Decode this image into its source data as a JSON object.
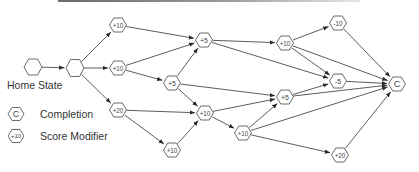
{
  "diagram": {
    "title_bar": "",
    "home_state_label": "Home State",
    "legend": {
      "items": [
        {
          "icon_text": "C",
          "label": "Completion"
        },
        {
          "icon_text": "+10",
          "label": "Score Modifier"
        }
      ]
    },
    "nodes": [
      {
        "id": "home",
        "label": "",
        "x": 33,
        "y": 67,
        "type": "start"
      },
      {
        "id": "hub",
        "label": "",
        "x": 75,
        "y": 68,
        "type": "hub"
      },
      {
        "id": "a1",
        "label": "+10",
        "x": 118,
        "y": 25,
        "type": "modifier"
      },
      {
        "id": "a2",
        "label": "+10",
        "x": 118,
        "y": 68,
        "type": "modifier"
      },
      {
        "id": "a3",
        "label": "+20",
        "x": 118,
        "y": 110,
        "type": "modifier"
      },
      {
        "id": "b1",
        "label": "+5",
        "x": 204,
        "y": 40,
        "type": "modifier"
      },
      {
        "id": "b2",
        "label": "+5",
        "x": 172,
        "y": 83,
        "type": "modifier"
      },
      {
        "id": "b3",
        "label": "+10",
        "x": 205,
        "y": 113,
        "type": "modifier"
      },
      {
        "id": "b4",
        "label": "+10",
        "x": 172,
        "y": 150,
        "type": "modifier"
      },
      {
        "id": "c1",
        "label": "+10",
        "x": 285,
        "y": 43,
        "type": "modifier"
      },
      {
        "id": "c2",
        "label": "+5",
        "x": 285,
        "y": 97,
        "type": "modifier"
      },
      {
        "id": "c3",
        "label": "+10",
        "x": 243,
        "y": 133,
        "type": "modifier"
      },
      {
        "id": "d1",
        "label": "-10",
        "x": 338,
        "y": 23,
        "type": "modifier"
      },
      {
        "id": "d2",
        "label": "-5",
        "x": 338,
        "y": 81,
        "type": "modifier"
      },
      {
        "id": "d3",
        "label": "+20",
        "x": 340,
        "y": 155,
        "type": "modifier"
      },
      {
        "id": "end",
        "label": "C",
        "x": 397,
        "y": 84,
        "type": "completion"
      }
    ],
    "edges": [
      [
        "home",
        "hub"
      ],
      [
        "hub",
        "a1"
      ],
      [
        "hub",
        "a2"
      ],
      [
        "hub",
        "a3"
      ],
      [
        "a1",
        "b1"
      ],
      [
        "a2",
        "b1"
      ],
      [
        "a2",
        "b2"
      ],
      [
        "b2",
        "b1"
      ],
      [
        "b2",
        "c2"
      ],
      [
        "b2",
        "b3"
      ],
      [
        "a3",
        "b3"
      ],
      [
        "a3",
        "b4"
      ],
      [
        "b4",
        "b3"
      ],
      [
        "b3",
        "c2"
      ],
      [
        "b3",
        "c3"
      ],
      [
        "b1",
        "c1"
      ],
      [
        "b1",
        "d2"
      ],
      [
        "c1",
        "d1"
      ],
      [
        "c1",
        "d2"
      ],
      [
        "c1",
        "end"
      ],
      [
        "d1",
        "end"
      ],
      [
        "d2",
        "end"
      ],
      [
        "c2",
        "d2"
      ],
      [
        "c2",
        "end"
      ],
      [
        "c3",
        "c2"
      ],
      [
        "c3",
        "end"
      ],
      [
        "c3",
        "d3"
      ],
      [
        "d3",
        "end"
      ]
    ]
  },
  "colors": {
    "edge": "#4a4a4a",
    "node_stroke": "#5a5a5a",
    "text": "#333333"
  }
}
